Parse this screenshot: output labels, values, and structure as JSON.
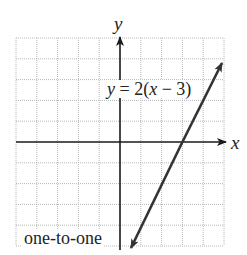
{
  "graph": {
    "equation_label": "y = 2(x − 3)",
    "equation_parts": {
      "lhs": "y",
      "eq": " = 2(",
      "var": "x",
      "rest": " − 3)"
    },
    "x_axis_label": "x",
    "y_axis_label": "y",
    "caption": "one-to-one",
    "grid": {
      "x_min": -5,
      "x_max": 5,
      "y_min": -5,
      "y_max": 5,
      "step": 1
    },
    "line": {
      "slope": 2,
      "x_intercept": 3,
      "y_intercept": -6,
      "from": [
        0.6,
        -4.8
      ],
      "to": [
        4.9,
        3.8
      ]
    },
    "colors": {
      "grid": "#b8b8b8",
      "axis": "#1a1a1a",
      "line": "#333333",
      "text": "#222222"
    }
  }
}
